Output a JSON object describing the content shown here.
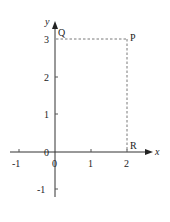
{
  "diagram": {
    "type": "coordinate-plane",
    "axes": {
      "x_label": "x",
      "y_label": "y",
      "origin_label": "0",
      "x_ticks": [
        "-1",
        "0",
        "1",
        "2"
      ],
      "y_ticks": [
        "3",
        "2",
        "1",
        "0",
        "-1"
      ]
    },
    "points": [
      {
        "name": "Q",
        "x": 0,
        "y": 3
      },
      {
        "name": "P",
        "x": 2,
        "y": 3
      },
      {
        "name": "R",
        "x": 2,
        "y": 0
      }
    ],
    "dashed_segments": [
      {
        "from": "Q",
        "to": "P"
      },
      {
        "from": "P",
        "to": "R"
      }
    ],
    "colors": {
      "axis": "#333333",
      "dashed": "#555555",
      "text": "#222222"
    }
  }
}
